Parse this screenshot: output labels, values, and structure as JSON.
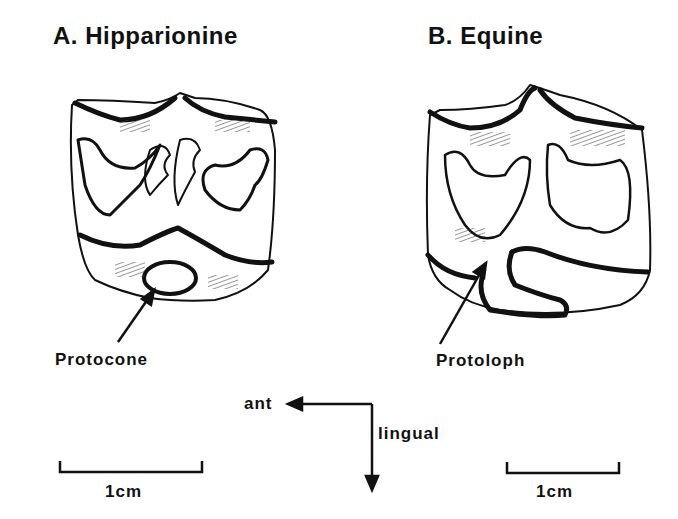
{
  "panels": [
    {
      "title": "A. Hipparionine",
      "label": "Protocone",
      "scale": "1cm"
    },
    {
      "title": "B. Equine",
      "label": "Protoloph",
      "scale": "1cm"
    }
  ],
  "orientation": {
    "horizontal": "ant",
    "vertical": "lingual"
  },
  "colors": {
    "ink": "#111111",
    "background": "#ffffff"
  }
}
